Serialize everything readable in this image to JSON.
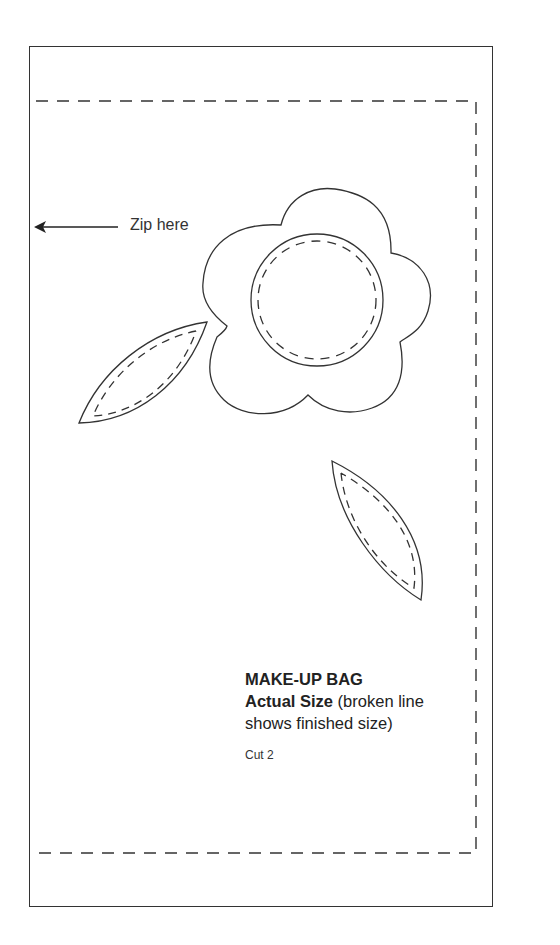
{
  "pattern": {
    "zip_label": "Zip here",
    "title": "MAKE-UP BAG",
    "subtitle_bold": "Actual Size",
    "subtitle_rest": " (broken line",
    "subtitle_line2": "shows finished size)",
    "cut_instruction": "Cut 2"
  },
  "colors": {
    "line": "#333333",
    "background": "#ffffff"
  },
  "shapes": {
    "flower": "five-petal flower with dashed circle center",
    "leaves": [
      "left leaf with dashed stitch line",
      "right leaf with dashed stitch line"
    ],
    "finished_size_outline": "dashed rectangle"
  }
}
